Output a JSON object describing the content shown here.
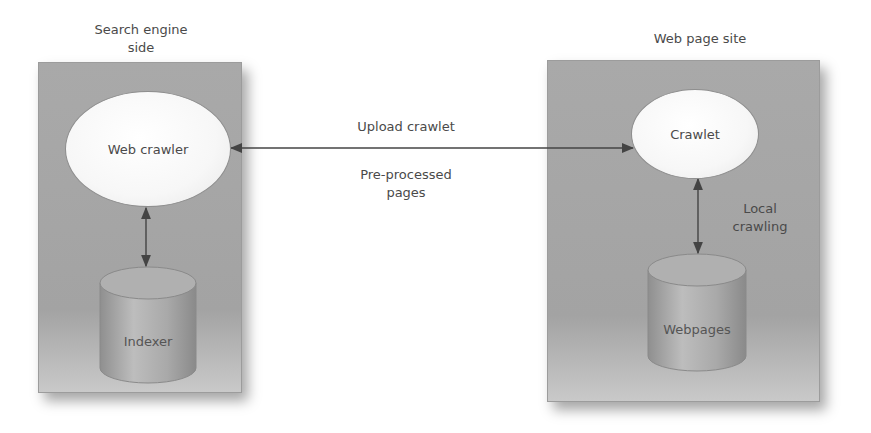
{
  "left_panel": {
    "title_line1": "Search engine",
    "title_line2": "side",
    "node_top": "Web crawler",
    "node_bottom": "Indexer"
  },
  "right_panel": {
    "title": "Web page site",
    "node_top": "Crawlet",
    "node_bottom": "Webpages",
    "edge_label_line1": "Local",
    "edge_label_line2": "crawling"
  },
  "connection": {
    "label_top": "Upload crawlet",
    "label_bottom_line1": "Pre-processed",
    "label_bottom_line2": "pages"
  },
  "colors": {
    "panel": "#a7a7a7",
    "node": "#f5f5f5",
    "arrow": "#444444",
    "text": "#4a4a4a"
  }
}
